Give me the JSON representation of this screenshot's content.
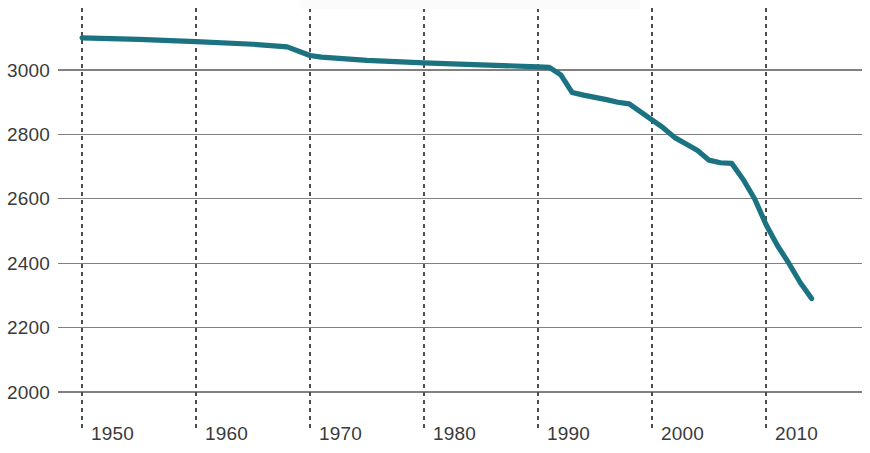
{
  "chart_data": {
    "type": "line",
    "title": "",
    "subtitle": "",
    "xlabel": "",
    "ylabel": "",
    "xlim": [
      1948,
      2015
    ],
    "ylim": [
      1950,
      3155
    ],
    "y_ticks": [
      2000,
      2200,
      2400,
      2600,
      2800,
      3000
    ],
    "x_ticks": [
      1950,
      1960,
      1970,
      1980,
      1990,
      2000,
      2010
    ],
    "grid": "horizontal-solid-and-vertical-dashed",
    "legend": "none",
    "series": [
      {
        "name": "series-1",
        "color": "#1b7382",
        "x": [
          1950,
          1955,
          1960,
          1965,
          1968,
          1970,
          1971,
          1975,
          1980,
          1985,
          1990,
          1991,
          1992,
          1993,
          1994,
          1995,
          1996,
          1997,
          1998,
          1999,
          2000,
          2001,
          2002,
          2003,
          2004,
          2005,
          2006,
          2007,
          2008,
          2009,
          2010,
          2011,
          2012,
          2013,
          2014
        ],
        "values": [
          3100,
          3095,
          3088,
          3080,
          3072,
          3045,
          3040,
          3030,
          3022,
          3016,
          3010,
          3008,
          2985,
          2930,
          2922,
          2915,
          2908,
          2900,
          2895,
          2870,
          2845,
          2820,
          2790,
          2770,
          2750,
          2720,
          2712,
          2710,
          2660,
          2600,
          2520,
          2455,
          2400,
          2340,
          2290
        ]
      }
    ]
  },
  "axis": {
    "y_tick_labels": [
      "3000",
      "2800",
      "2600",
      "2400",
      "2200",
      "2000"
    ],
    "x_tick_labels": [
      "1950",
      "1960",
      "1970",
      "1980",
      "1990",
      "2000",
      "2010"
    ]
  },
  "colors": {
    "line": "#1b7382",
    "gridline": "#808080",
    "vertical_dashed": "#4d4d4d",
    "text": "#3a3a3a",
    "background": "#ffffff"
  }
}
